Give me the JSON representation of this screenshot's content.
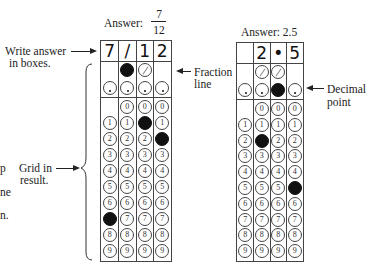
{
  "left_example": {
    "title": "Answer:",
    "fraction": {
      "numerator": "7",
      "denominator": "12"
    },
    "boxes": [
      "7",
      "/",
      "1",
      "2"
    ],
    "fraction_row": [
      null,
      "filled",
      "slash",
      null
    ],
    "decimal_row": [
      "dot",
      "dot",
      "dot",
      "dot"
    ],
    "digit_rows": {
      "0": [
        null,
        "0",
        "0",
        "0"
      ],
      "1": [
        "1",
        "1",
        "filled",
        "1"
      ],
      "2": [
        "2",
        "2",
        "2",
        "filled"
      ],
      "3": [
        "3",
        "3",
        "3",
        "3"
      ],
      "4": [
        "4",
        "4",
        "4",
        "4"
      ],
      "5": [
        "5",
        "5",
        "5",
        "5"
      ],
      "6": [
        "6",
        "6",
        "6",
        "6"
      ],
      "7": [
        "filled",
        "7",
        "7",
        "7"
      ],
      "8": [
        "8",
        "8",
        "8",
        "8"
      ],
      "9": [
        "9",
        "9",
        "9",
        "9"
      ]
    }
  },
  "right_example": {
    "title": "Answer: 2.5",
    "boxes": [
      "",
      "2",
      "•",
      "5"
    ],
    "fraction_row": [
      null,
      "slash",
      "slash",
      null
    ],
    "decimal_row": [
      "dot",
      "dot",
      "filled",
      "dot"
    ],
    "digit_rows": {
      "0": [
        null,
        "0",
        "0",
        "0"
      ],
      "1": [
        "1",
        "1",
        "1",
        "1"
      ],
      "2": [
        "2",
        "filled",
        "2",
        "2"
      ],
      "3": [
        "3",
        "3",
        "3",
        "3"
      ],
      "4": [
        "4",
        "4",
        "4",
        "4"
      ],
      "5": [
        "5",
        "5",
        "5",
        "filled"
      ],
      "6": [
        "6",
        "6",
        "6",
        "6"
      ],
      "7": [
        "7",
        "7",
        "7",
        "7"
      ],
      "8": [
        "8",
        "8",
        "8",
        "8"
      ],
      "9": [
        "9",
        "9",
        "9",
        "9"
      ]
    }
  },
  "annotations": {
    "write_answer_line1": "Write answer",
    "write_answer_line2": "in boxes.",
    "fraction_line_1": "Fraction",
    "fraction_line_2": "line",
    "decimal_point_1": "Decimal",
    "decimal_point_2": "point",
    "grid_in_1": "Grid in",
    "grid_in_2": "result.",
    "cut_text": [
      "p",
      "ne",
      "n."
    ]
  },
  "colors": {
    "ink": "#222222",
    "fill": "#111111",
    "background": "#ffffff"
  }
}
